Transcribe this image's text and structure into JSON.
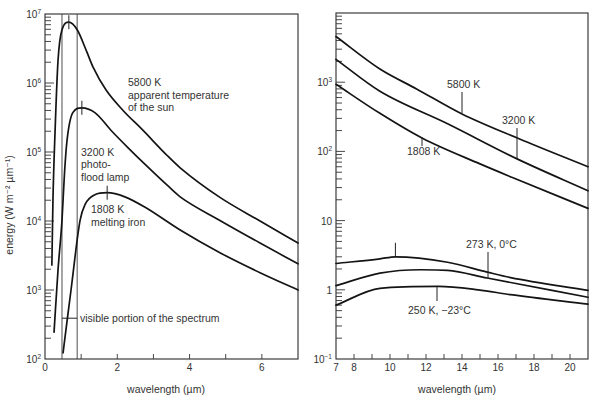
{
  "chart_data": [
    {
      "panel": "left",
      "type": "line",
      "title": "",
      "xlabel": "wavelength (µm)",
      "ylabel": "energy (W m⁻² µm⁻¹)",
      "xlim": [
        0,
        7
      ],
      "ylim": [
        100,
        10000000
      ],
      "yscale": "log",
      "grid": false,
      "legend": "none (curves labelled inline)",
      "xticks": [
        {
          "value": 0,
          "label": "0"
        },
        {
          "value": 2,
          "label": "2"
        },
        {
          "value": 4,
          "label": "4"
        },
        {
          "value": 6,
          "label": "6"
        }
      ],
      "xminor": [
        1,
        3,
        5
      ],
      "yticks": [
        {
          "value": 100,
          "base": "10",
          "exp": "2"
        },
        {
          "value": 1000,
          "base": "10",
          "exp": "3"
        },
        {
          "value": 10000,
          "base": "10",
          "exp": "4"
        },
        {
          "value": 100000,
          "base": "10",
          "exp": "5"
        },
        {
          "value": 1000000,
          "base": "10",
          "exp": "6"
        },
        {
          "value": 10000000,
          "base": "10",
          "exp": "7"
        }
      ],
      "visible_band": {
        "x": [
          0.47,
          0.89
        ],
        "marker_y": 390,
        "label": "visible portion of the spectrum"
      },
      "series": [
        {
          "name": "5800 K",
          "label_lines": [
            "5800 K",
            "apparent temperature",
            "of the sun"
          ],
          "peak": [
            0.66,
            7600000
          ],
          "points": [
            [
              0.19,
              2300
            ],
            [
              0.22,
              20000
            ],
            [
              0.28,
              210000
            ],
            [
              0.36,
              2100000
            ],
            [
              0.47,
              5900000
            ],
            [
              0.66,
              7600000
            ],
            [
              0.89,
              5900000
            ],
            [
              1.16,
              2800000
            ],
            [
              1.33,
              1700000
            ],
            [
              1.69,
              790000
            ],
            [
              2.16,
              400000
            ],
            [
              2.68,
              214000
            ],
            [
              3.38,
              89000
            ],
            [
              3.74,
              59000
            ],
            [
              4.84,
              22000
            ],
            [
              5.95,
              10000
            ],
            [
              7.0,
              4800
            ]
          ]
        },
        {
          "name": "3200 K",
          "label_lines": [
            "3200 K",
            "photo-",
            "flood lamp"
          ],
          "peak": [
            1.02,
            437000
          ],
          "points": [
            [
              0.25,
              245
            ],
            [
              0.36,
              1950
            ],
            [
              0.47,
              10200
            ],
            [
              0.54,
              50000
            ],
            [
              0.61,
              148000
            ],
            [
              0.77,
              372000
            ],
            [
              1.02,
              437000
            ],
            [
              1.38,
              372000
            ],
            [
              1.85,
              200000
            ],
            [
              2.3,
              115000
            ],
            [
              2.77,
              66000
            ],
            [
              3.38,
              33000
            ],
            [
              3.74,
              22400
            ],
            [
              4.84,
              10200
            ],
            [
              5.95,
              4800
            ],
            [
              7.0,
              2400
            ]
          ]
        },
        {
          "name": "1808 K",
          "label_lines": [
            "1808 K",
            "melting iron"
          ],
          "peak": [
            1.72,
            25700
          ],
          "points": [
            [
              0.5,
              123
            ],
            [
              0.61,
              355
            ],
            [
              0.72,
              1000
            ],
            [
              0.97,
              10200
            ],
            [
              1.11,
              17400
            ],
            [
              1.38,
              24000
            ],
            [
              1.72,
              25700
            ],
            [
              2.21,
              22400
            ],
            [
              2.77,
              15800
            ],
            [
              3.74,
              7400
            ],
            [
              4.84,
              3470
            ],
            [
              5.95,
              1780
            ],
            [
              7.0,
              1000
            ]
          ]
        }
      ]
    },
    {
      "panel": "right",
      "type": "line",
      "title": "",
      "xlabel": "wavelength (µm)",
      "ylabel": "",
      "xlim": [
        7,
        21
      ],
      "ylim": [
        0.1,
        10000
      ],
      "yscale": "log",
      "grid": false,
      "legend": "none (curves labelled inline)",
      "xticks": [
        {
          "value": 7,
          "label": "7"
        },
        {
          "value": 8,
          "label": "8"
        },
        {
          "value": 10,
          "label": "10"
        },
        {
          "value": 12,
          "label": "12"
        },
        {
          "value": 14,
          "label": "14"
        },
        {
          "value": 16,
          "label": "16"
        },
        {
          "value": 18,
          "label": "18"
        },
        {
          "value": 20,
          "label": "20"
        }
      ],
      "xminor": [
        9,
        11,
        13,
        15,
        17,
        19
      ],
      "yticks": [
        {
          "value": 0.1,
          "base": "10",
          "exp": "-1"
        },
        {
          "value": 1,
          "base": "1",
          "exp": ""
        },
        {
          "value": 10,
          "base": "10",
          "exp": ""
        },
        {
          "value": 100,
          "base": "10",
          "exp": "2"
        },
        {
          "value": 1000,
          "base": "10",
          "exp": "3"
        }
      ],
      "series": [
        {
          "name": "5800 K",
          "label_lines": [
            "5800 K"
          ],
          "points": [
            [
              7,
              4570
            ],
            [
              9.44,
              1550
            ],
            [
              11.5,
              794
            ],
            [
              14,
              347
            ],
            [
              17.2,
              151
            ],
            [
              21,
              60
            ]
          ]
        },
        {
          "name": "3200 K",
          "label_lines": [
            "3200 K"
          ],
          "points": [
            [
              7,
              2140
            ],
            [
              9.44,
              741
            ],
            [
              13.2,
              251
            ],
            [
              17.06,
              78
            ],
            [
              21,
              27
            ]
          ]
        },
        {
          "name": "1808 K",
          "label_lines": [
            "1808 K"
          ],
          "points": [
            [
              7,
              933
            ],
            [
              9.44,
              355
            ],
            [
              11.8,
              155
            ],
            [
              15,
              66
            ],
            [
              16.8,
              42
            ],
            [
              21,
              15
            ]
          ]
        },
        {
          "name": "(unlabeled)",
          "label_lines": [],
          "peak": [
            10.3,
            3.0
          ],
          "points": [
            [
              7,
              2.4
            ],
            [
              9.44,
              2.8
            ],
            [
              10.3,
              3.0
            ],
            [
              13.2,
              2.5
            ],
            [
              15.4,
              1.8
            ],
            [
              16.7,
              1.5
            ],
            [
              21,
              0.98
            ]
          ]
        },
        {
          "name": "273 K, 0°C",
          "label_lines": [
            "273 K, 0°C"
          ],
          "points": [
            [
              7,
              1.15
            ],
            [
              9.44,
              1.74
            ],
            [
              11.7,
              1.95
            ],
            [
              13.2,
              1.91
            ],
            [
              15.4,
              1.48
            ],
            [
              21,
              0.78
            ]
          ]
        },
        {
          "name": "250 K, −23°C",
          "label_lines": [
            "250 K, −23°C"
          ],
          "points": [
            [
              7,
              0.6
            ],
            [
              9.44,
              1.05
            ],
            [
              12.7,
              1.12
            ],
            [
              14.9,
              1.0
            ],
            [
              16.7,
              0.85
            ],
            [
              21,
              0.62
            ]
          ]
        }
      ]
    }
  ]
}
